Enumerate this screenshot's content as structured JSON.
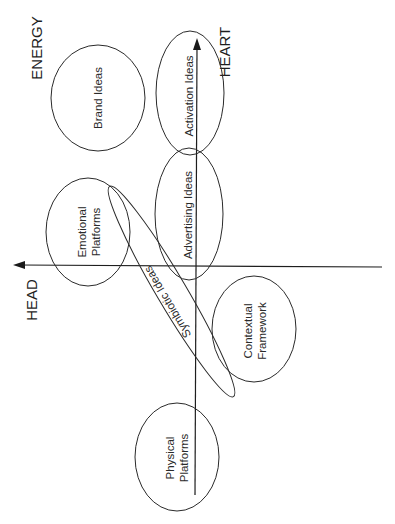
{
  "diagram": {
    "orientation": "rotated-90-ccw",
    "colors": {
      "stroke": "#2a2a2a",
      "axis": "#1e1e1e",
      "background": "#ffffff"
    },
    "axes": {
      "vertical_top_label": "HEART",
      "horizontal_left_label": "HEAD",
      "corner_label": "ENERGY"
    },
    "ellipses": [
      {
        "id": "brand-ideas",
        "label": "Brand Ideas",
        "lines": [
          "Brand Ideas"
        ]
      },
      {
        "id": "activation-ideas",
        "label": "Activation Ideas",
        "lines": [
          "Activation Ideas"
        ]
      },
      {
        "id": "emotional-platforms",
        "label": "Emotional Platforms",
        "lines": [
          "Emotional",
          "Platforms"
        ]
      },
      {
        "id": "advertising-ideas",
        "label": "Advertising Ideas",
        "lines": [
          "Advertising Ideas"
        ]
      },
      {
        "id": "symbiotic-ideas",
        "label": "Symbiotic Ideas",
        "lines": [
          "Symbiotic Ideas"
        ]
      },
      {
        "id": "contextual-framework",
        "label": "Contextual Framework",
        "lines": [
          "Contextual",
          "Framework"
        ]
      },
      {
        "id": "physical-platforms",
        "label": "Physical Platforms",
        "lines": [
          "Physical",
          "Platforms"
        ]
      }
    ]
  }
}
